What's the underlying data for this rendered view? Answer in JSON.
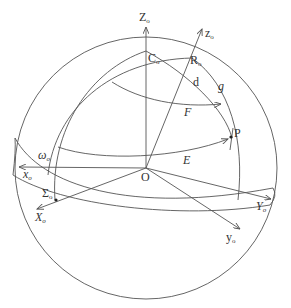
{
  "diagram": {
    "type": "celestial-sphere-coordinate-diagram",
    "colors": {
      "line": "#555555",
      "text": "#333333",
      "background": "#ffffff"
    },
    "labels": {
      "Z0": {
        "main": "Z",
        "sub": "o"
      },
      "z0": {
        "main": "z",
        "sub": "o"
      },
      "C0": {
        "main": "C",
        "sub": "o"
      },
      "R0": {
        "main": "R",
        "sub": "o"
      },
      "d": {
        "main": "d"
      },
      "g": {
        "main": "g"
      },
      "F": {
        "main": "F"
      },
      "E": {
        "main": "E"
      },
      "P": {
        "main": "P"
      },
      "O": {
        "main": "O"
      },
      "omega0": {
        "main": "ω",
        "sub": "o"
      },
      "x0": {
        "main": "x",
        "sub": "o"
      },
      "Sigma0": {
        "main": "Σ",
        "sub": "o"
      },
      "X0": {
        "main": "X",
        "sub": "o"
      },
      "Y0": {
        "main": "Y",
        "sub": "o"
      },
      "y0": {
        "main": "y",
        "sub": "o"
      }
    },
    "points": [
      "O",
      "C0",
      "R0",
      "P",
      "Sigma0"
    ],
    "axes": [
      "Z0",
      "z0",
      "x0",
      "X0",
      "Y0",
      "y0"
    ],
    "arcs": [
      "d",
      "g",
      "F",
      "E",
      "omega0"
    ]
  }
}
